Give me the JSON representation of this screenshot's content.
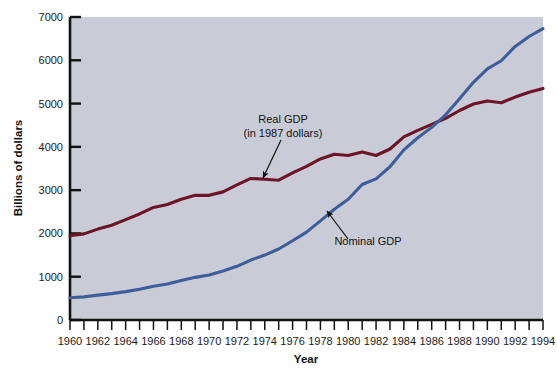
{
  "chart_data": {
    "type": "line",
    "title": "",
    "xlabel": "Year",
    "ylabel": "Billions of dollars",
    "xlim": [
      1960,
      1994
    ],
    "ylim": [
      0,
      7000
    ],
    "grid": false,
    "legend_position": "inline-annotations",
    "x_tick_step": 1,
    "x_label_step": 2,
    "y_tick_step": 1000,
    "x_tick_labels": [
      "1960",
      "1962",
      "1964",
      "1966",
      "1968",
      "1970",
      "1972",
      "1974",
      "1976",
      "1978",
      "1980",
      "1982",
      "1984",
      "1986",
      "1988",
      "1990",
      "1992",
      "1994"
    ],
    "y_tick_labels": [
      "0",
      "1000",
      "2000",
      "3000",
      "4000",
      "5000",
      "6000",
      "7000"
    ],
    "plot_background": "#c9ccd6",
    "x": [
      1960,
      1961,
      1962,
      1963,
      1964,
      1965,
      1966,
      1967,
      1968,
      1969,
      1970,
      1971,
      1972,
      1973,
      1974,
      1975,
      1976,
      1977,
      1978,
      1979,
      1980,
      1981,
      1982,
      1983,
      1984,
      1985,
      1986,
      1987,
      1988,
      1989,
      1990,
      1991,
      1992,
      1993,
      1994
    ],
    "series": [
      {
        "name": "Real GDP",
        "label": "Real GDP",
        "sublabel": "(in 1987 dollars)",
        "color": "#6d1426",
        "values": [
          1950,
          1990,
          2100,
          2190,
          2320,
          2450,
          2600,
          2670,
          2790,
          2880,
          2880,
          2960,
          3120,
          3270,
          3250,
          3230,
          3400,
          3550,
          3720,
          3830,
          3800,
          3880,
          3800,
          3950,
          4230,
          4380,
          4520,
          4660,
          4840,
          4990,
          5060,
          5020,
          5150,
          5260,
          5350
        ]
      },
      {
        "name": "Nominal GDP",
        "label": "Nominal GDP",
        "sublabel": "",
        "color": "#3e5e9b",
        "values": [
          515,
          535,
          575,
          610,
          655,
          710,
          780,
          830,
          910,
          985,
          1040,
          1130,
          1240,
          1385,
          1500,
          1640,
          1830,
          2030,
          2290,
          2560,
          2790,
          3130,
          3260,
          3540,
          3930,
          4210,
          4450,
          4740,
          5110,
          5490,
          5800,
          5990,
          6320,
          6550,
          6730
        ]
      }
    ],
    "annotations": [
      {
        "name": "real-gdp-annotation",
        "line1": "Real GDP",
        "line2": "(in 1987 dollars)",
        "text_x": 283,
        "text_y": 123,
        "arrow_from_x": 281,
        "arrow_from_y": 140,
        "arrow_to_x": 263,
        "arrow_to_y": 178
      },
      {
        "name": "nominal-gdp-annotation",
        "line1": "Nominal GDP",
        "line2": "",
        "text_x": 368,
        "text_y": 245,
        "arrow_from_x": 348,
        "arrow_from_y": 239,
        "arrow_to_x": 327,
        "arrow_to_y": 211
      }
    ]
  }
}
